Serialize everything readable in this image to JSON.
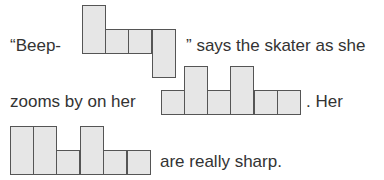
{
  "sentence": {
    "part1": "“Beep-",
    "part2": "” says the skater as she",
    "part3": "zooms by on her",
    "part4": ". Her",
    "part5": "are really sharp."
  },
  "puzzle_1": {
    "description": "letter-box shape for word 1",
    "column_heights": [
      2,
      1,
      1,
      "1 (descender)"
    ]
  },
  "puzzle_2": {
    "description": "letter-box shape for word 2",
    "column_heights": [
      1,
      2,
      1,
      2,
      1,
      1
    ]
  },
  "puzzle_3": {
    "description": "letter-box shape for word 3",
    "column_heights": [
      2,
      2,
      1,
      2,
      1,
      1
    ]
  },
  "colors": {
    "box_fill": "#e6e6e6",
    "box_border": "#555555",
    "text": "#333333"
  }
}
